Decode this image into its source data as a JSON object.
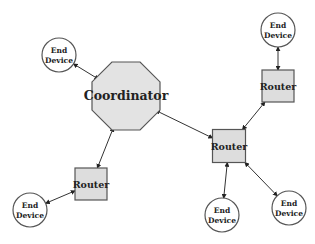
{
  "diagram": {
    "type": "network-topology",
    "colors": {
      "background": "#ffffff",
      "node_fill": "#dddddd",
      "device_fill": "#ffffff",
      "stroke": "#555555",
      "text": "#222222"
    },
    "nodes": [
      {
        "id": "coordinator",
        "kind": "coordinator",
        "shape": "octagon",
        "label": "Coordinator"
      },
      {
        "id": "router-left",
        "kind": "router",
        "shape": "square",
        "label": "Router"
      },
      {
        "id": "router-center",
        "kind": "router",
        "shape": "square",
        "label": "Router"
      },
      {
        "id": "router-top-right",
        "kind": "router",
        "shape": "square",
        "label": "Router"
      },
      {
        "id": "end-device-top-left",
        "kind": "end-device",
        "shape": "circle",
        "label_lines": [
          "End",
          "Device"
        ]
      },
      {
        "id": "end-device-top-right",
        "kind": "end-device",
        "shape": "circle",
        "label_lines": [
          "End",
          "Device"
        ]
      },
      {
        "id": "end-device-bottom-left",
        "kind": "end-device",
        "shape": "circle",
        "label_lines": [
          "End",
          "Device"
        ]
      },
      {
        "id": "end-device-bottom-center",
        "kind": "end-device",
        "shape": "circle",
        "label_lines": [
          "End",
          "Device"
        ]
      },
      {
        "id": "end-device-bottom-right",
        "kind": "end-device",
        "shape": "circle",
        "label_lines": [
          "End",
          "Device"
        ]
      }
    ],
    "edges": [
      {
        "from": "end-device-top-left",
        "to": "coordinator",
        "bidirectional": true
      },
      {
        "from": "coordinator",
        "to": "router-left",
        "bidirectional": true
      },
      {
        "from": "coordinator",
        "to": "router-center",
        "bidirectional": true
      },
      {
        "from": "router-left",
        "to": "end-device-bottom-left",
        "bidirectional": true
      },
      {
        "from": "router-center",
        "to": "router-top-right",
        "bidirectional": true
      },
      {
        "from": "router-top-right",
        "to": "end-device-top-right",
        "bidirectional": true
      },
      {
        "from": "router-center",
        "to": "end-device-bottom-center",
        "bidirectional": true
      },
      {
        "from": "router-center",
        "to": "end-device-bottom-right",
        "bidirectional": true
      }
    ]
  }
}
